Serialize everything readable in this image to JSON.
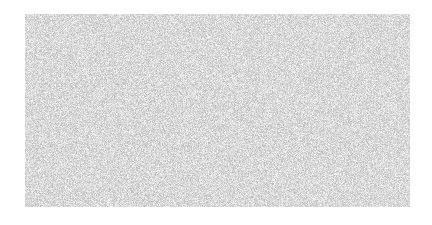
{
  "canvas": {
    "width": 432,
    "height": 225,
    "background_color": "#ffffff"
  },
  "noise_panel": {
    "label": "random-noise-texture",
    "x": 25,
    "y": 14,
    "width": 385,
    "height": 193,
    "pattern": "uniform-random-grayscale-static",
    "grain_size_px": 1,
    "base_color": "#ffffff",
    "speckle_color_min": "#b8b8b8",
    "speckle_color_max": "#fafafa",
    "gray_min": 184,
    "gray_max": 250,
    "density": 1.0,
    "seed": 20240517,
    "border": "none",
    "contains_text": false
  }
}
